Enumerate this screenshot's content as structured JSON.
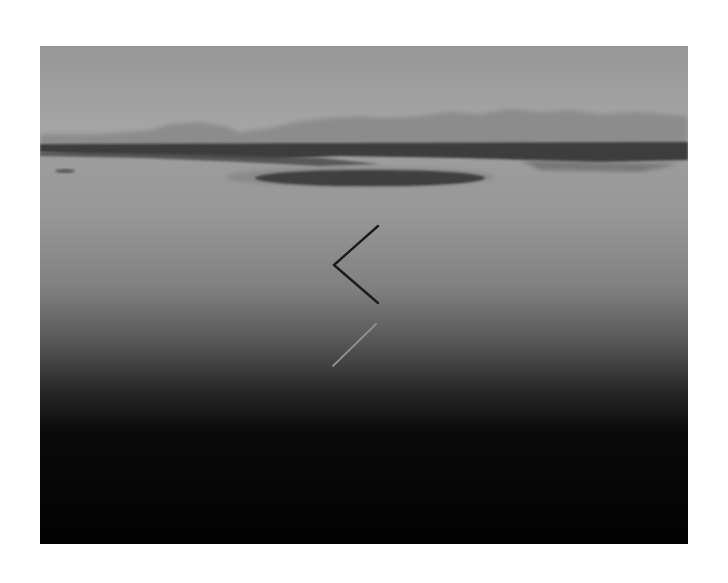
{
  "image": {
    "kind": "black-and-white landscape photograph",
    "subject": "calm lake with a bent stick and its reflection, distant hazy mountains",
    "palette": {
      "border": "#ffffff",
      "sky_top": "#9c9c9c",
      "sky_horizon": "#a6a6a6",
      "mountains": "#8a8a8a",
      "shoreline": "#3a3a3a",
      "island": "#2e2e2e",
      "water_upper": "#9a9a9a",
      "water_mid": "#6a6a6a",
      "water_dark": "#0a0a0a",
      "stick": "#1c1c1c",
      "stick_reflection": "#8c8c8c"
    }
  }
}
